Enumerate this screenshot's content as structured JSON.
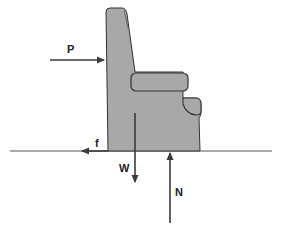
{
  "diagram": {
    "type": "free-body diagram",
    "colors": {
      "chair_fill": "#a8a8a8",
      "outline": "#333333",
      "arrow": "#3a3a3a",
      "ground": "#555555",
      "background": "#ffffff"
    },
    "forces": [
      {
        "id": "P",
        "label": "P",
        "direction": "right",
        "description": "applied push on chair back"
      },
      {
        "id": "f",
        "label": "f",
        "direction": "left",
        "description": "friction at floor"
      },
      {
        "id": "W",
        "label": "W",
        "direction": "down",
        "description": "weight"
      },
      {
        "id": "N",
        "label": "N",
        "direction": "up",
        "description": "normal force"
      }
    ]
  }
}
